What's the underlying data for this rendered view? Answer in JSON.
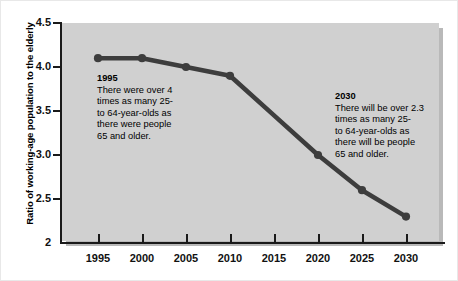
{
  "chart_data": {
    "type": "line",
    "title": "",
    "xlabel": "",
    "ylabel": "Ratio of working-age population to the elderly",
    "x": [
      1995,
      2000,
      2005,
      2010,
      2015,
      2020,
      2025,
      2030
    ],
    "categories": [
      "1995",
      "2000",
      "2005",
      "2010",
      "2015",
      "2020",
      "2025",
      "2030"
    ],
    "values": [
      4.1,
      4.1,
      4.0,
      3.9,
      3.45,
      3.0,
      2.6,
      2.3
    ],
    "markers_at": [
      1995,
      2000,
      2005,
      2010,
      2020,
      2025,
      2030
    ],
    "series": [
      {
        "name": "Ratio of working-age population to the elderly",
        "values": [
          4.1,
          4.1,
          4.0,
          3.9,
          3.45,
          3.0,
          2.6,
          2.3
        ]
      }
    ],
    "xlim": [
      1993,
      2033
    ],
    "ylim": [
      2,
      4.5
    ],
    "ytick_labels": [
      "4.5",
      "4.0",
      "3.5",
      "3.0",
      "2.5",
      "2"
    ],
    "ytick_values": [
      4.5,
      4.0,
      3.5,
      3.0,
      2.5,
      2.0
    ],
    "xtick_labels": [
      "1995",
      "2000",
      "2005",
      "2010",
      "2015",
      "2020",
      "2025",
      "2030"
    ],
    "grid": false,
    "legend": "none",
    "line_color": "#3d3d3d",
    "plot_background": "#d0d0d0",
    "page_background": "#ffffff",
    "annotations": [
      {
        "id": "1995",
        "heading": "1995",
        "text": "There were over 4 times as many 25- to 64-year-olds as there were people 65 and older."
      },
      {
        "id": "2030",
        "heading": "2030",
        "text": "There will be over 2.3 times as many 25- to 64-year-olds as there will be people 65 and older."
      }
    ]
  },
  "annotations": {
    "a1995": {
      "heading": "1995",
      "line1": "There were over 4",
      "line2": "times as many 25-",
      "line3": "to 64-year-olds as",
      "line4": "there were people",
      "line5": "65 and older.",
      "body": "There were over 4\ntimes as many 25-\nto 64-year-olds as\nthere were people\n65 and older."
    },
    "a2030": {
      "heading": "2030",
      "line1": "There will be over 2.3",
      "line2": "times as many 25-",
      "line3": "to 64-year-olds as",
      "line4": "there will be people",
      "line5": "65 and older.",
      "body": "There will be over 2.3\ntimes as many 25-\nto 64-year-olds as\nthere will be people\n65 and older."
    }
  },
  "axis": {
    "y_title": "Ratio of working-age population to the elderly",
    "y_ticks": [
      "4.5",
      "4.0",
      "3.5",
      "3.0",
      "2.5",
      "2"
    ],
    "x_ticks": [
      "1995",
      "2000",
      "2005",
      "2010",
      "2015",
      "2020",
      "2025",
      "2030"
    ]
  }
}
